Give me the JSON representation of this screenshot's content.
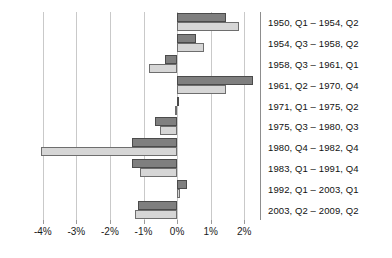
{
  "chart_data": {
    "type": "bar",
    "orientation": "horizontal",
    "title": "",
    "subtitle": "",
    "xlabel": "",
    "ylabel": "",
    "grid": true,
    "legend_position": "none",
    "xlim": [
      -4.5,
      2.5
    ],
    "xticks": [
      -4,
      -3,
      -2,
      -1,
      0,
      1,
      2
    ],
    "xtick_labels": [
      "-4%",
      "-3%",
      "-2%",
      "-1%",
      "0%",
      "1%",
      "2%"
    ],
    "categories": [
      "1950, Q1 – 1954, Q2",
      "1954, Q3 – 1958, Q2",
      "1958, Q3 – 1961, Q1",
      "1961, Q2 – 1970, Q4",
      "1971, Q1 – 1975, Q2",
      "1975, Q3 – 1980, Q3",
      "1980, Q4 – 1982, Q4",
      "1983, Q1 – 1991, Q4",
      "1992, Q1 – 2003, Q1",
      "2003, Q2 – 2009, Q2"
    ],
    "series": [
      {
        "name": "series-dark",
        "color": "#7f7f7f",
        "values": [
          1.45,
          0.55,
          -0.35,
          2.25,
          0.05,
          -0.65,
          -1.35,
          -1.35,
          0.3,
          -1.15
        ]
      },
      {
        "name": "series-light",
        "color": "#d6d6d6",
        "values": [
          1.85,
          0.8,
          -0.85,
          1.45,
          -0.05,
          -0.5,
          -4.05,
          -1.1,
          0.1,
          -1.25
        ]
      }
    ]
  },
  "axis": {
    "zero_value": 0,
    "right_edge_value": 2.5
  }
}
